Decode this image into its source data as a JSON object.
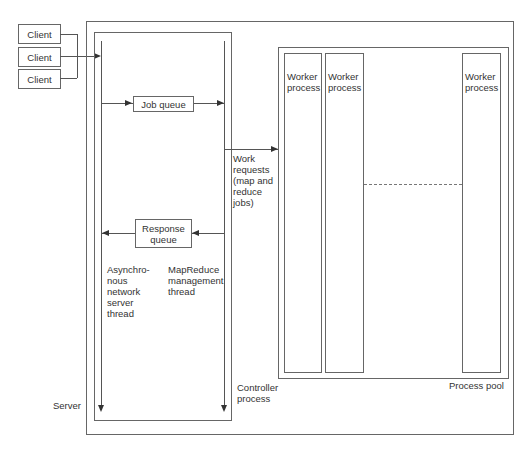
{
  "diagram": {
    "clients": [
      {
        "label": "Client"
      },
      {
        "label": "Client"
      },
      {
        "label": "Client"
      }
    ],
    "server": {
      "label": "Server"
    },
    "controller": {
      "label": "Controller\nprocess"
    },
    "threads": {
      "async": {
        "label": "Asynchro-\nnous\nnetwork\nserver\nthread"
      },
      "mapreduce": {
        "label": "MapReduce\nmanagement\nthread"
      }
    },
    "job_queue": {
      "label": "Job queue"
    },
    "response_queue": {
      "label": "Response\nqueue"
    },
    "work_requests": {
      "label": "Work\nrequests\n(map and\nreduce\njobs)"
    },
    "process_pool": {
      "label": "Process pool",
      "workers": [
        {
          "label": "Worker\nprocess"
        },
        {
          "label": "Worker\nprocess"
        },
        {
          "label": "Worker\nprocess"
        }
      ]
    },
    "colors": {
      "line": "#555555",
      "text": "#333333",
      "background": "#ffffff"
    }
  }
}
